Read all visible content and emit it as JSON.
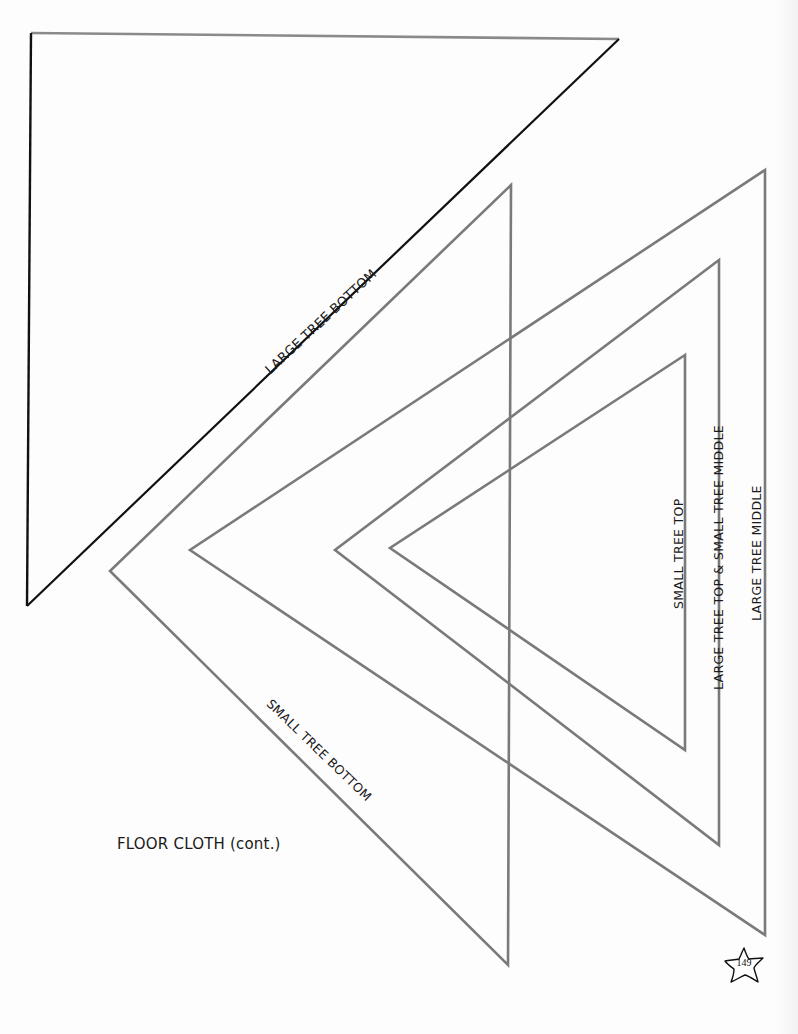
{
  "page": {
    "caption": "FLOOR CLOTH (cont.)",
    "page_number": "149",
    "page_number_badge_icon": "star-icon"
  },
  "templates": [
    {
      "id": "large-tree-bottom",
      "label": "LARGE TREE BOTTOM",
      "points": "31,33 619,39 27,606",
      "stroke": "#111111"
    },
    {
      "id": "small-tree-bottom",
      "label": "SMALL TREE BOTTOM",
      "points": "511,185 110,571 508,965",
      "stroke": "#7a7a7a"
    },
    {
      "id": "large-tree-middle",
      "label": "LARGE TREE MIDDLE",
      "points": "765,170 190,550 765,935",
      "stroke": "#7a7a7a"
    },
    {
      "id": "large-tree-top-small-tree-middle",
      "label": "LARGE TREE TOP & SMALL TREE MIDDLE",
      "points": "719,260 335,550 719,845",
      "stroke": "#7a7a7a"
    },
    {
      "id": "small-tree-top",
      "label": "SMALL TREE TOP",
      "points": "685,355 390,548 685,750",
      "stroke": "#7a7a7a"
    }
  ],
  "colors": {
    "outline_dark": "#111111",
    "outline_gray": "#7a7a7a",
    "top_edge_gray": "#8a8a8a",
    "text": "#1a1a1a"
  }
}
